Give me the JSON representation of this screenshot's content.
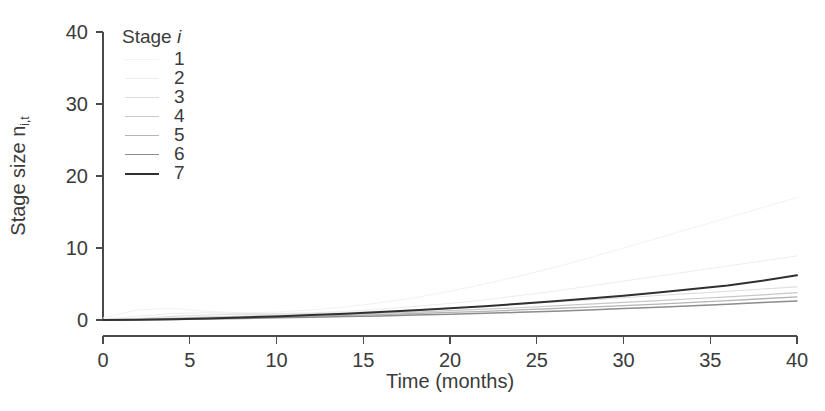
{
  "figure": {
    "width": 825,
    "height": 411,
    "background": "#ffffff"
  },
  "axes": {
    "x": {
      "title": "Time (months)",
      "ticks": [
        "0",
        "5",
        "10",
        "15",
        "20",
        "25",
        "30",
        "35",
        "40"
      ],
      "pixel_left": 103,
      "pixel_right": 797
    },
    "y": {
      "title_prefix": "Stage size n",
      "title_sub": "i,t",
      "ticks": [
        "0",
        "10",
        "20",
        "30",
        "40"
      ],
      "pixel_bottom": 320,
      "pixel_top": 32
    }
  },
  "legend": {
    "title_prefix": "Stage ",
    "title_symbol": "i",
    "entries": [
      {
        "label": "1",
        "color": "#f2f2f2",
        "width": 1.0
      },
      {
        "label": "2",
        "color": "#ededed",
        "width": 1.0
      },
      {
        "label": "3",
        "color": "#dedede",
        "width": 1.1
      },
      {
        "label": "4",
        "color": "#c8c8c8",
        "width": 1.2
      },
      {
        "label": "5",
        "color": "#b4b4b4",
        "width": 1.3
      },
      {
        "label": "6",
        "color": "#8c8c8c",
        "width": 1.5
      },
      {
        "label": "7",
        "color": "#303030",
        "width": 2.0
      }
    ]
  },
  "chart_data": {
    "type": "line",
    "title": "",
    "xlabel": "Time (months)",
    "ylabel": "Stage size n_i,t",
    "xlim": [
      0,
      40
    ],
    "ylim": [
      0,
      40
    ],
    "xticks": [
      0,
      5,
      10,
      15,
      20,
      25,
      30,
      35,
      40
    ],
    "yticks": [
      0,
      10,
      20,
      30,
      40
    ],
    "grid": false,
    "legend_position": "upper-left-inside",
    "legend_title": "Stage i",
    "x": [
      0,
      2,
      4,
      6,
      8,
      10,
      12,
      14,
      16,
      18,
      20,
      22,
      24,
      26,
      28,
      30,
      32,
      34,
      36,
      38,
      40
    ],
    "series": [
      {
        "name": "1",
        "color": "#f2f2f2",
        "width": 1.0,
        "values": [
          0.3,
          1.4,
          1.6,
          1.2,
          1.0,
          1.1,
          1.4,
          1.8,
          2.4,
          3.1,
          4.0,
          5.0,
          6.1,
          7.3,
          8.6,
          10.0,
          11.4,
          12.8,
          14.2,
          15.6,
          17.0
        ]
      },
      {
        "name": "2",
        "color": "#ededed",
        "width": 1.0,
        "values": [
          0.1,
          0.5,
          0.9,
          1.0,
          0.9,
          0.9,
          1.0,
          1.2,
          1.5,
          1.9,
          2.3,
          2.8,
          3.4,
          4.0,
          4.7,
          5.4,
          6.1,
          6.8,
          7.5,
          8.2,
          8.9
        ]
      },
      {
        "name": "3",
        "color": "#dedede",
        "width": 1.1,
        "values": [
          0.05,
          0.2,
          0.5,
          0.7,
          0.8,
          0.8,
          0.9,
          1.0,
          1.2,
          1.4,
          1.6,
          1.9,
          2.2,
          2.5,
          2.8,
          3.1,
          3.4,
          3.7,
          4.0,
          4.3,
          4.6
        ]
      },
      {
        "name": "4",
        "color": "#c8c8c8",
        "width": 1.2,
        "values": [
          0.02,
          0.1,
          0.25,
          0.4,
          0.5,
          0.6,
          0.7,
          0.8,
          0.95,
          1.1,
          1.3,
          1.5,
          1.7,
          1.95,
          2.2,
          2.45,
          2.7,
          2.95,
          3.2,
          3.5,
          3.8
        ]
      },
      {
        "name": "5",
        "color": "#b4b4b4",
        "width": 1.3,
        "values": [
          0.01,
          0.05,
          0.15,
          0.25,
          0.35,
          0.45,
          0.55,
          0.65,
          0.75,
          0.9,
          1.05,
          1.2,
          1.4,
          1.6,
          1.8,
          2.0,
          2.2,
          2.45,
          2.7,
          2.95,
          3.2
        ]
      },
      {
        "name": "6",
        "color": "#8c8c8c",
        "width": 1.5,
        "values": [
          0.0,
          0.03,
          0.08,
          0.15,
          0.22,
          0.3,
          0.38,
          0.47,
          0.57,
          0.68,
          0.8,
          0.93,
          1.07,
          1.23,
          1.4,
          1.58,
          1.78,
          1.98,
          2.2,
          2.42,
          2.65
        ]
      },
      {
        "name": "7",
        "color": "#303030",
        "width": 2.0,
        "values": [
          0.0,
          0.05,
          0.12,
          0.22,
          0.35,
          0.5,
          0.68,
          0.88,
          1.1,
          1.35,
          1.62,
          1.92,
          2.25,
          2.6,
          2.98,
          3.38,
          3.82,
          4.3,
          4.8,
          5.45,
          6.2
        ]
      }
    ]
  }
}
